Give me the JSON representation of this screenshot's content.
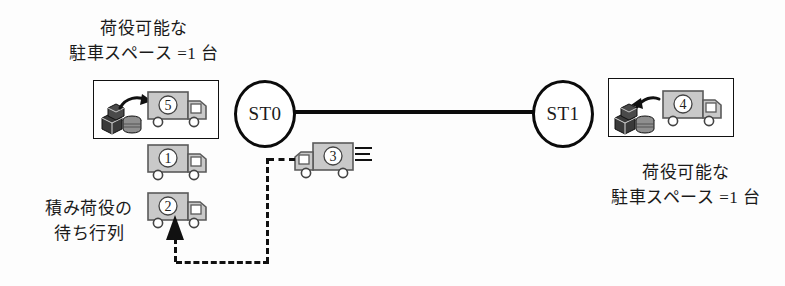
{
  "diagram": {
    "stations": [
      {
        "id": "st0",
        "label": "ST0"
      },
      {
        "id": "st1",
        "label": "ST1"
      }
    ],
    "captions": {
      "left_bay": "荷役可能な\n駐車スペース =1 台",
      "left_bay_line1": "荷役可能な",
      "left_bay_line2": "駐車スペース =1 台",
      "right_bay_line1": "荷役可能な",
      "right_bay_line2": "駐車スペース =1 台",
      "queue_line1": "積み荷役の",
      "queue_line2": "待ち行列"
    },
    "trucks": [
      {
        "id": "truck-5",
        "number": "⑤",
        "location": "left-bay",
        "facing": "right",
        "state": "loading"
      },
      {
        "id": "truck-1",
        "number": "①",
        "location": "left-queue",
        "facing": "right",
        "state": "waiting"
      },
      {
        "id": "truck-2",
        "number": "②",
        "location": "left-queue",
        "facing": "right",
        "state": "waiting"
      },
      {
        "id": "truck-3",
        "number": "③",
        "location": "in-transit",
        "facing": "left",
        "state": "moving"
      },
      {
        "id": "truck-4",
        "number": "④",
        "location": "right-bay",
        "facing": "right",
        "state": "unloading"
      }
    ],
    "cargo": [
      {
        "id": "cargo-left",
        "arrow_direction": "right",
        "meaning": "load-onto-truck"
      },
      {
        "id": "cargo-right",
        "arrow_direction": "left",
        "meaning": "unload-from-truck"
      }
    ],
    "route": {
      "style": "dashed",
      "direction": "from-truck-3-to-queue",
      "arrow_direction": "up"
    },
    "colors": {
      "line": "#0b0b0b",
      "truck_body": "#c9c9c9",
      "truck_outline": "#5a5a5a",
      "background": "#ffffff"
    }
  }
}
